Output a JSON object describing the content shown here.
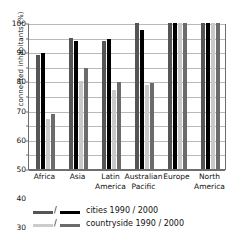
{
  "chart_data": {
    "type": "bar",
    "title": "",
    "xlabel": "",
    "ylabel": "connected inhabitants (%)",
    "ylim": [
      0,
      100
    ],
    "yticks": [
      0,
      10,
      20,
      30,
      40,
      50,
      60,
      70,
      80,
      90,
      100
    ],
    "grid": true,
    "legend_position": "bottom-left",
    "categories": [
      "Africa",
      "Asia",
      "Latin America",
      "Australian Pacific",
      "Europe",
      "North America"
    ],
    "series": [
      {
        "name": "cities 1990",
        "key": "c90",
        "color": "#555555",
        "values": [
          78,
          90,
          88,
          100,
          100,
          100
        ]
      },
      {
        "name": "cities 2000",
        "key": "c00",
        "color": "#000000",
        "values": [
          79.5,
          88,
          89,
          95,
          100,
          100
        ]
      },
      {
        "name": "countryside 1990",
        "key": "r90",
        "color": "#c9c9c9",
        "values": [
          34.5,
          60,
          54,
          57.5,
          100,
          100
        ]
      },
      {
        "name": "countryside 2000",
        "key": "r00",
        "color": "#6b6b6b",
        "values": [
          38,
          69,
          59.5,
          59,
          100,
          100
        ]
      }
    ]
  },
  "axis": {
    "y_title": "connected inhabitants (%)",
    "tick_labels": [
      "100",
      "90",
      "80",
      "70",
      "60",
      "50",
      "40",
      "30",
      "20",
      "10",
      "0"
    ]
  },
  "x_labels": [
    {
      "line1": "Africa",
      "line2": ""
    },
    {
      "line1": "Asia",
      "line2": ""
    },
    {
      "line1": "Latin",
      "line2": "America"
    },
    {
      "line1": "Australian",
      "line2": "Pacific"
    },
    {
      "line1": "Europe",
      "line2": ""
    },
    {
      "line1": "North",
      "line2": "America"
    }
  ],
  "legend": {
    "separator": "/",
    "rows": [
      {
        "label": "cities 1990 / 2000",
        "swatch_left": "#555555",
        "swatch_right": "#000000"
      },
      {
        "label": "countryside 1990 / 2000",
        "swatch_left": "#cccccc",
        "swatch_right": "#6b6b6b"
      }
    ]
  }
}
